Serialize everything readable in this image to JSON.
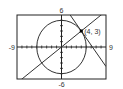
{
  "chart_data": {
    "type": "line",
    "title": "",
    "xlabel": "",
    "ylabel": "",
    "xlim": [
      -9,
      9
    ],
    "ylim": [
      -6,
      6
    ],
    "x_tick_labels": {
      "min": "-9",
      "max": "9"
    },
    "y_tick_labels": {
      "min": "-6",
      "max": "6"
    },
    "tick_step": 1,
    "grid": false,
    "series": [
      {
        "name": "circle",
        "kind": "circle",
        "center": [
          0,
          0
        ],
        "radius": 5
      },
      {
        "name": "radius-line",
        "kind": "line",
        "slope": 0.75,
        "intercept": 0
      },
      {
        "name": "tangent-line",
        "kind": "line",
        "slope": -1.3333,
        "intercept": 8.3333
      }
    ],
    "annotations": [
      {
        "label": "(4, 3)",
        "x": 4,
        "y": 3
      }
    ]
  }
}
